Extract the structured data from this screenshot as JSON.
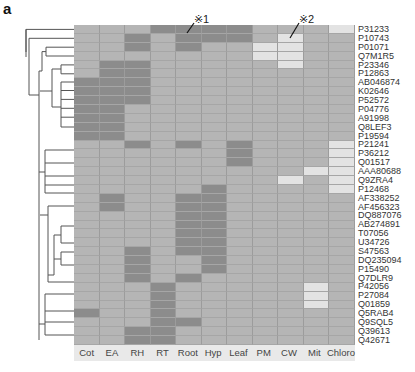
{
  "panel_label": "a",
  "annotations": [
    {
      "label": "※1",
      "column": "Root",
      "row": "P31233"
    },
    {
      "label": "※2",
      "column": "CW",
      "row": "P10743"
    }
  ],
  "legend_levels": {
    "0": "intermediate",
    "1": "high (dark)",
    "2": "low (light)"
  },
  "colors": {
    "mid": "#b5b5b5",
    "dark": "#8c8c8c",
    "light": "#e3e3e3",
    "grid": "#9c9c9c"
  },
  "chart_data": {
    "type": "heatmap",
    "title": "",
    "xlabel": "",
    "ylabel": "",
    "columns": [
      "Cot",
      "EA",
      "RH",
      "RT",
      "Root",
      "Hyp",
      "Leaf",
      "PM",
      "CW",
      "Mit",
      "Chloro"
    ],
    "rows": [
      "P31233",
      "P10743",
      "P01071",
      "Q7M1R5",
      "P23346",
      "P12863",
      "AB046874",
      "K02646",
      "P52572",
      "P04776",
      "A91998",
      "Q8LEF3",
      "P19594",
      "P21241",
      "P36212",
      "Q01517",
      "AAA80688",
      "Q9ZRA4",
      "P12468",
      "AF338252",
      "AF456323",
      "DQ887076",
      "AB274891",
      "T07056",
      "U34726",
      "S47563",
      "DQ235094",
      "P15490",
      "Q7DLR9",
      "P42056",
      "P27084",
      "Q01859",
      "Q5RAB4",
      "Q9SQL5",
      "Q39613",
      "Q42671"
    ],
    "value_encoding": "0 = mid gray, 1 = dark gray, 2 = light gray",
    "values": [
      [
        0,
        0,
        0,
        1,
        1,
        1,
        1,
        0,
        0,
        0,
        2
      ],
      [
        0,
        0,
        1,
        0,
        1,
        1,
        1,
        0,
        2,
        0,
        0
      ],
      [
        0,
        0,
        1,
        0,
        1,
        0,
        0,
        2,
        2,
        0,
        0
      ],
      [
        0,
        0,
        0,
        0,
        0,
        0,
        0,
        2,
        2,
        0,
        0
      ],
      [
        0,
        1,
        1,
        0,
        0,
        0,
        0,
        0,
        2,
        0,
        0
      ],
      [
        0,
        1,
        1,
        0,
        0,
        0,
        0,
        0,
        0,
        0,
        0
      ],
      [
        1,
        1,
        1,
        0,
        0,
        0,
        0,
        0,
        0,
        0,
        0
      ],
      [
        1,
        1,
        1,
        0,
        0,
        0,
        0,
        0,
        0,
        0,
        0
      ],
      [
        1,
        1,
        1,
        0,
        0,
        0,
        0,
        0,
        0,
        0,
        0
      ],
      [
        1,
        1,
        0,
        0,
        0,
        0,
        0,
        0,
        0,
        0,
        0
      ],
      [
        1,
        1,
        0,
        0,
        0,
        0,
        0,
        0,
        0,
        0,
        0
      ],
      [
        1,
        1,
        0,
        0,
        0,
        0,
        0,
        0,
        0,
        0,
        0
      ],
      [
        1,
        1,
        0,
        0,
        0,
        0,
        0,
        0,
        0,
        0,
        0
      ],
      [
        0,
        0,
        1,
        0,
        1,
        0,
        1,
        0,
        0,
        0,
        2
      ],
      [
        0,
        0,
        0,
        0,
        0,
        0,
        1,
        0,
        0,
        0,
        2
      ],
      [
        0,
        0,
        0,
        0,
        0,
        0,
        1,
        0,
        0,
        0,
        2
      ],
      [
        0,
        0,
        0,
        0,
        0,
        0,
        0,
        0,
        0,
        2,
        2
      ],
      [
        0,
        0,
        0,
        0,
        0,
        0,
        0,
        0,
        2,
        0,
        2
      ],
      [
        0,
        0,
        0,
        0,
        0,
        1,
        0,
        0,
        0,
        0,
        2
      ],
      [
        0,
        1,
        0,
        0,
        1,
        1,
        0,
        0,
        0,
        0,
        0
      ],
      [
        0,
        1,
        0,
        0,
        1,
        1,
        0,
        0,
        0,
        0,
        0
      ],
      [
        0,
        0,
        0,
        0,
        1,
        1,
        0,
        0,
        0,
        0,
        0
      ],
      [
        0,
        0,
        0,
        0,
        1,
        1,
        0,
        0,
        0,
        0,
        0
      ],
      [
        0,
        0,
        0,
        0,
        1,
        1,
        0,
        0,
        0,
        0,
        0
      ],
      [
        0,
        0,
        0,
        0,
        1,
        1,
        0,
        0,
        0,
        0,
        0
      ],
      [
        0,
        0,
        1,
        0,
        1,
        1,
        0,
        0,
        0,
        0,
        0
      ],
      [
        0,
        0,
        1,
        0,
        0,
        1,
        0,
        0,
        0,
        0,
        0
      ],
      [
        0,
        0,
        1,
        0,
        0,
        1,
        0,
        0,
        0,
        0,
        0
      ],
      [
        0,
        0,
        1,
        0,
        1,
        0,
        0,
        0,
        0,
        0,
        0
      ],
      [
        0,
        0,
        0,
        1,
        0,
        0,
        0,
        0,
        0,
        2,
        0
      ],
      [
        0,
        0,
        0,
        1,
        0,
        0,
        0,
        0,
        0,
        2,
        0
      ],
      [
        0,
        0,
        0,
        1,
        0,
        0,
        0,
        0,
        0,
        2,
        0
      ],
      [
        1,
        0,
        0,
        1,
        0,
        0,
        0,
        0,
        0,
        0,
        0
      ],
      [
        0,
        0,
        0,
        1,
        1,
        0,
        0,
        0,
        0,
        0,
        0
      ],
      [
        0,
        0,
        1,
        1,
        0,
        0,
        0,
        0,
        0,
        0,
        0
      ],
      [
        0,
        0,
        1,
        1,
        0,
        0,
        0,
        0,
        0,
        0,
        0
      ]
    ],
    "dendrogram": "row clustering tree drawn on left",
    "legend_position": "none",
    "grid": true
  }
}
